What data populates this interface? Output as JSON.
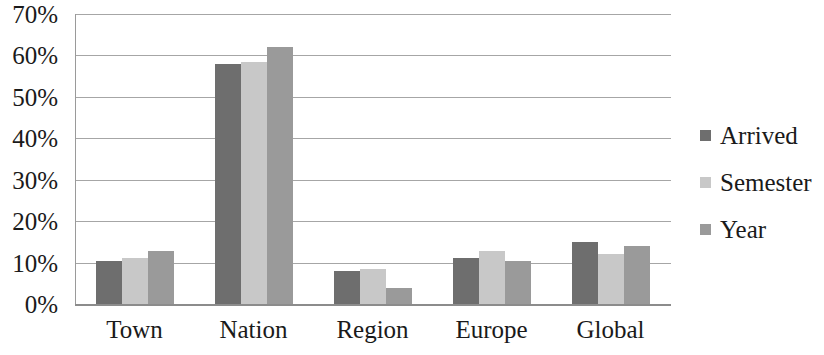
{
  "chart_data": {
    "type": "bar",
    "title": "",
    "subtitle": "",
    "xlabel": "",
    "ylabel": "",
    "categories": [
      "Town",
      "Nation",
      "Region",
      "Europe",
      "Global"
    ],
    "series": [
      {
        "name": "Arrived",
        "color": "#6e6e6e",
        "values": [
          10.3,
          58.0,
          8.0,
          11.2,
          15.0
        ]
      },
      {
        "name": "Semester",
        "color": "#c8c8c8",
        "values": [
          11.0,
          58.3,
          8.4,
          12.8,
          12.0
        ]
      },
      {
        "name": "Year",
        "color": "#9a9a9a",
        "values": [
          12.7,
          62.0,
          3.9,
          10.5,
          14.0
        ]
      }
    ],
    "ylim": [
      0,
      70
    ],
    "y_tick_values": [
      70,
      60,
      50,
      40,
      30,
      20,
      10,
      0
    ],
    "y_tick_labels": [
      "70%",
      "60%",
      "50%",
      "40%",
      "30%",
      "20%",
      "10%",
      "0%"
    ],
    "y_tick_step": 10,
    "value_suffix": "%",
    "grid": true,
    "grid_axis": "y",
    "legend_position": "right",
    "legend_entries": [
      "Arrived",
      "Semester",
      "Year"
    ],
    "axis_color": "#a6a6a6",
    "text_color": "#1a1a1a",
    "background": "#ffffff"
  }
}
